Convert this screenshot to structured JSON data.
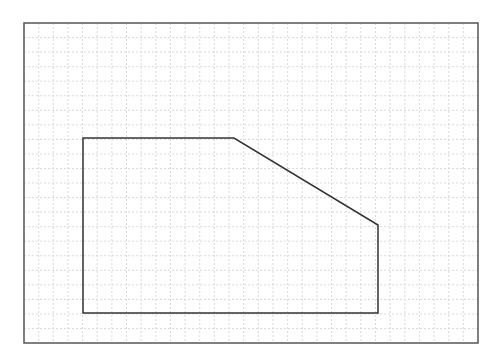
{
  "canvas": {
    "width": 504,
    "height": 362,
    "background": "#ffffff"
  },
  "frame": {
    "x": 24,
    "y": 23,
    "width": 454,
    "height": 320,
    "stroke": "#555555",
    "stroke_width": 1.5
  },
  "grid": {
    "columns": 31,
    "rows": 22,
    "color": "#cfcfcf",
    "dash": "2,2",
    "stroke_width": 0.8
  },
  "shape": {
    "type": "polygon",
    "stroke": "#333333",
    "stroke_width": 1.5,
    "fill": "none",
    "points": [
      [
        83,
        138
      ],
      [
        234,
        138
      ],
      [
        378,
        225
      ],
      [
        378,
        313
      ],
      [
        83,
        313
      ]
    ]
  }
}
